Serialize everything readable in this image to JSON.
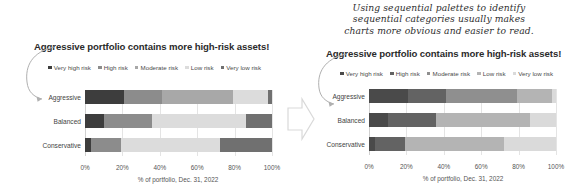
{
  "annotation": {
    "lines": [
      "Using sequential palettes to identify",
      "sequential categories usually makes",
      "charts more obvious and easier to read."
    ]
  },
  "icons": {
    "curved_arrow": "curved-arrow-icon",
    "transition_arrow": "right-arrow-icon"
  },
  "chart_data": [
    {
      "id": "before",
      "type": "bar",
      "orientation": "horizontal",
      "stacked": true,
      "stack_mode": "percent",
      "title": "Aggressive portfolio contains more high-risk assets!",
      "xlabel": "% of portfolio, Dec. 31, 2022",
      "ylabel": "",
      "categories": [
        "Aggressive",
        "Balanced",
        "Conservative"
      ],
      "xlim": [
        0,
        100
      ],
      "xticks": [
        0,
        20,
        40,
        60,
        80,
        100
      ],
      "xticklabels": [
        "0%",
        "20%",
        "40%",
        "60%",
        "80%",
        "100%"
      ],
      "grid": true,
      "legend_position": "top",
      "palette_type": "categorical",
      "series": [
        {
          "name": "Very high risk",
          "color": "#3d3d3d",
          "values": [
            21,
            10,
            3
          ]
        },
        {
          "name": "High risk",
          "color": "#8c8c8c",
          "values": [
            20,
            26,
            16
          ]
        },
        {
          "name": "Moderate risk",
          "color": "#a8a8a8",
          "values": [
            38,
            0,
            0
          ]
        },
        {
          "name": "Low risk",
          "color": "#dcdcdc",
          "values": [
            19,
            50,
            53
          ]
        },
        {
          "name": "Very low risk",
          "color": "#707070",
          "values": [
            2,
            14,
            28
          ]
        }
      ]
    },
    {
      "id": "after",
      "type": "bar",
      "orientation": "horizontal",
      "stacked": true,
      "stack_mode": "percent",
      "title": "Aggressive portfolio contains more high-risk assets!",
      "xlabel": "% of portfolio, Dec. 31, 2022",
      "ylabel": "",
      "categories": [
        "Aggressive",
        "Balanced",
        "Conservative"
      ],
      "xlim": [
        0,
        100
      ],
      "xticks": [
        0,
        20,
        40,
        60,
        80,
        100
      ],
      "xticklabels": [
        "0%",
        "20%",
        "40%",
        "60%",
        "80%",
        "100%"
      ],
      "grid": true,
      "legend_position": "top",
      "palette_type": "sequential",
      "series": [
        {
          "name": "Very high risk",
          "color": "#4a4a4a",
          "values": [
            21,
            10,
            3
          ]
        },
        {
          "name": "High risk",
          "color": "#636363",
          "values": [
            20,
            26,
            16
          ]
        },
        {
          "name": "Moderate risk",
          "color": "#8f8f8f",
          "values": [
            38,
            0,
            0
          ]
        },
        {
          "name": "Low risk",
          "color": "#b4b4b4",
          "values": [
            19,
            50,
            53
          ]
        },
        {
          "name": "Very low risk",
          "color": "#dadada",
          "values": [
            2,
            14,
            28
          ]
        }
      ]
    }
  ]
}
